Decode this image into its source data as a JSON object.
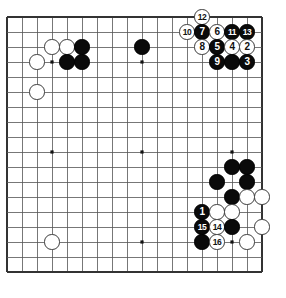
{
  "diagram": {
    "type": "go-board-diagram",
    "board_size": 18,
    "grid": {
      "origin_x": 7,
      "origin_y": 17,
      "spacing": 15,
      "lines": 18,
      "line_color": "#555555",
      "border_color": "#333333",
      "background_color": "#ffffff"
    },
    "star_points": [
      {
        "col": 4,
        "row": 4
      },
      {
        "col": 10,
        "row": 4
      },
      {
        "col": 16,
        "row": 4
      },
      {
        "col": 4,
        "row": 10
      },
      {
        "col": 10,
        "row": 10
      },
      {
        "col": 16,
        "row": 10
      },
      {
        "col": 4,
        "row": 16
      },
      {
        "col": 10,
        "row": 16
      },
      {
        "col": 16,
        "row": 16
      }
    ],
    "colors": {
      "black_stone": "#0a0a0a",
      "white_stone": "#ffffff",
      "stone_outline": "#3a3a3a",
      "black_label": "#ffffff",
      "white_label": "#111111"
    },
    "stones": [
      {
        "name": "white-stone-c4",
        "color": "white",
        "col": 4,
        "row": 3,
        "label": ""
      },
      {
        "name": "white-stone-d4",
        "color": "white",
        "col": 5,
        "row": 3,
        "label": ""
      },
      {
        "name": "black-stone-e4",
        "color": "black",
        "col": 6,
        "row": 3,
        "label": ""
      },
      {
        "name": "white-stone-b5",
        "color": "white",
        "col": 3,
        "row": 4,
        "label": ""
      },
      {
        "name": "black-stone-d5",
        "color": "black",
        "col": 5,
        "row": 4,
        "label": ""
      },
      {
        "name": "black-stone-e5",
        "color": "black",
        "col": 6,
        "row": 4,
        "label": ""
      },
      {
        "name": "white-stone-b7",
        "color": "white",
        "col": 3,
        "row": 6,
        "label": ""
      },
      {
        "name": "black-stone-j4",
        "color": "black",
        "col": 10,
        "row": 3,
        "label": ""
      },
      {
        "name": "white-stone-move-12",
        "color": "white",
        "col": 14,
        "row": 1,
        "label": "12"
      },
      {
        "name": "white-stone-move-10",
        "color": "white",
        "col": 13,
        "row": 2,
        "label": "10"
      },
      {
        "name": "black-stone-move-7",
        "color": "black",
        "col": 14,
        "row": 2,
        "label": "7"
      },
      {
        "name": "white-stone-move-6",
        "color": "white",
        "col": 15,
        "row": 2,
        "label": "6"
      },
      {
        "name": "black-stone-move-11",
        "color": "black",
        "col": 16,
        "row": 2,
        "label": "11"
      },
      {
        "name": "black-stone-move-13",
        "color": "black",
        "col": 17,
        "row": 2,
        "label": "13"
      },
      {
        "name": "white-stone-move-8",
        "color": "white",
        "col": 14,
        "row": 3,
        "label": "8"
      },
      {
        "name": "black-stone-move-5",
        "color": "black",
        "col": 15,
        "row": 3,
        "label": "5"
      },
      {
        "name": "white-stone-move-4",
        "color": "white",
        "col": 16,
        "row": 3,
        "label": "4"
      },
      {
        "name": "white-stone-move-2",
        "color": "white",
        "col": 17,
        "row": 3,
        "label": "2"
      },
      {
        "name": "black-stone-move-9",
        "color": "black",
        "col": 15,
        "row": 4,
        "label": "9"
      },
      {
        "name": "black-stone-r5",
        "color": "black",
        "col": 16,
        "row": 4,
        "label": ""
      },
      {
        "name": "black-stone-move-3",
        "color": "black",
        "col": 17,
        "row": 4,
        "label": "3"
      },
      {
        "name": "black-stone-q12",
        "color": "black",
        "col": 16,
        "row": 11,
        "label": ""
      },
      {
        "name": "black-stone-r12",
        "color": "black",
        "col": 17,
        "row": 11,
        "label": ""
      },
      {
        "name": "black-stone-p13",
        "color": "black",
        "col": 15,
        "row": 12,
        "label": ""
      },
      {
        "name": "black-stone-r13",
        "color": "black",
        "col": 17,
        "row": 12,
        "label": ""
      },
      {
        "name": "black-stone-q14",
        "color": "black",
        "col": 16,
        "row": 13,
        "label": ""
      },
      {
        "name": "white-stone-r14",
        "color": "white",
        "col": 17,
        "row": 13,
        "label": ""
      },
      {
        "name": "white-stone-s14",
        "color": "white",
        "col": 18,
        "row": 13,
        "label": ""
      },
      {
        "name": "black-stone-move-1",
        "color": "black",
        "col": 14,
        "row": 14,
        "label": "1"
      },
      {
        "name": "white-stone-p15",
        "color": "white",
        "col": 15,
        "row": 14,
        "label": ""
      },
      {
        "name": "white-stone-q15",
        "color": "white",
        "col": 16,
        "row": 14,
        "label": ""
      },
      {
        "name": "black-stone-move-15",
        "color": "black",
        "col": 14,
        "row": 15,
        "label": "15"
      },
      {
        "name": "white-stone-move-14",
        "color": "white",
        "col": 15,
        "row": 15,
        "label": "14"
      },
      {
        "name": "black-stone-q16",
        "color": "black",
        "col": 16,
        "row": 15,
        "label": ""
      },
      {
        "name": "white-stone-s16",
        "color": "white",
        "col": 18,
        "row": 15,
        "label": ""
      },
      {
        "name": "black-stone-n17",
        "color": "black",
        "col": 14,
        "row": 16,
        "label": ""
      },
      {
        "name": "white-stone-move-16",
        "color": "white",
        "col": 15,
        "row": 16,
        "label": "16"
      },
      {
        "name": "white-stone-r17",
        "color": "white",
        "col": 17,
        "row": 16,
        "label": ""
      },
      {
        "name": "white-stone-d16",
        "color": "white",
        "col": 4,
        "row": 16,
        "label": ""
      }
    ]
  }
}
